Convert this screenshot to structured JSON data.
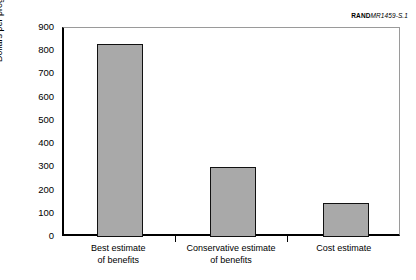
{
  "credit": {
    "rand": "RAND",
    "document": "MR1459-S.1"
  },
  "chart_data": {
    "type": "bar",
    "title": "",
    "xlabel": "",
    "ylabel": "Dollars per program participant",
    "ylim": [
      0,
      900
    ],
    "ytick_step": 100,
    "grid": false,
    "legend": false,
    "bar_fill_color": "#a9a9a9",
    "bar_edge_color": "#111111",
    "categories": [
      "Best estimate\nof benefits",
      "Conservative estimate\nof benefits",
      "Cost estimate"
    ],
    "category_lines": [
      [
        "Best estimate",
        "of benefits"
      ],
      [
        "Conservative estimate",
        "of benefits"
      ],
      [
        "Cost estimate",
        ""
      ]
    ],
    "values": [
      830,
      300,
      145
    ],
    "ytick_labels": [
      "0",
      "100",
      "200",
      "300",
      "400",
      "500",
      "600",
      "700",
      "800",
      "900"
    ],
    "ytick_values": [
      0,
      100,
      200,
      300,
      400,
      500,
      600,
      700,
      800,
      900
    ]
  }
}
